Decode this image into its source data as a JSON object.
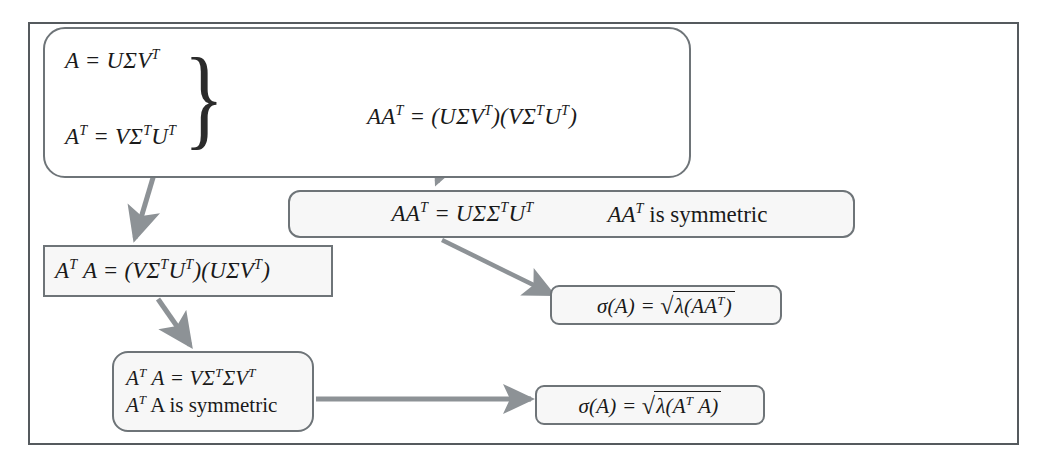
{
  "diagram": {
    "frame_color": "#555a5e",
    "node_border_color": "#6e7478",
    "arrow_color": "#8d9296",
    "node_fill": "#f7f7f7"
  },
  "nodes": {
    "primary": {
      "eq_a": "A = UΣV",
      "eq_a_sup": "T",
      "eq_at_lhs": "A",
      "eq_at_lhs_sup": "T",
      "eq_at_rhs": " = VΣ",
      "eq_at_sup1": "T",
      "eq_at_rhs2": "U",
      "eq_at_sup2": "T",
      "brace": "}",
      "eq_aat": "AA",
      "eq_aat_sup": "T",
      "eq_aat_rest": " = (UΣV",
      "eq_aat_sup2": "T",
      "eq_aat_rest2": ")(VΣ",
      "eq_aat_sup3": "T",
      "eq_aat_rest3": "U",
      "eq_aat_sup4": "T",
      "eq_aat_rest4": ")"
    },
    "aat_symmetric": {
      "eq_lhs": "AA",
      "eq_lhs_sup": "T",
      "eq_mid": " = UΣΣ",
      "eq_sup2": "T",
      "eq_rest": "U",
      "eq_sup3": "T",
      "note_sym_lhs": "AA",
      "note_sym_sup": "T",
      "note_sym_text": " is symmetric"
    },
    "ata_expanded": {
      "eq_lhs": "A",
      "eq_lhs_sup": "T",
      "eq_lhs2": " A = (VΣ",
      "eq_sup2": "T",
      "eq_mid": "U",
      "eq_sup3": "T",
      "eq_mid2": ")(UΣV",
      "eq_sup4": "T",
      "eq_end": ")"
    },
    "sigma_aat": {
      "prefix": "σ(A) = ",
      "radical": "√",
      "radicand_lead": "λ(AA",
      "radicand_sup": "T",
      "radicand_tail": ")"
    },
    "ata_symmetric": {
      "line1_lhs": "A",
      "line1_sup": "T",
      "line1_mid": " A = VΣ",
      "line1_sup2": "T",
      "line1_rest": "ΣV",
      "line1_sup3": "T",
      "line2_lhs": "A",
      "line2_sup": "T",
      "line2_text": " A  is symmetric"
    },
    "sigma_ata": {
      "prefix": "σ(A) = ",
      "radical": "√",
      "radicand_lead": "λ(A",
      "radicand_sup": "T",
      "radicand_tail": " A)"
    }
  },
  "arrows": [
    {
      "name": "brace-to-aat",
      "from": "primary-brace",
      "to": "primary-eq-aat"
    },
    {
      "name": "aat-to-aat-symmetric",
      "from": "primary-eq-aat",
      "to": "aat-symmetric-box"
    },
    {
      "name": "primary-to-ata-expanded",
      "from": "primary-box",
      "to": "ata-expanded-box"
    },
    {
      "name": "aat-symmetric-to-sigma-aat",
      "from": "aat-symmetric-box",
      "to": "sigma-aat-box"
    },
    {
      "name": "ata-expanded-to-ata-symmetric",
      "from": "ata-expanded-box",
      "to": "ata-symmetric-box"
    },
    {
      "name": "ata-symmetric-to-sigma-ata",
      "from": "ata-symmetric-box",
      "to": "sigma-ata-box"
    }
  ]
}
